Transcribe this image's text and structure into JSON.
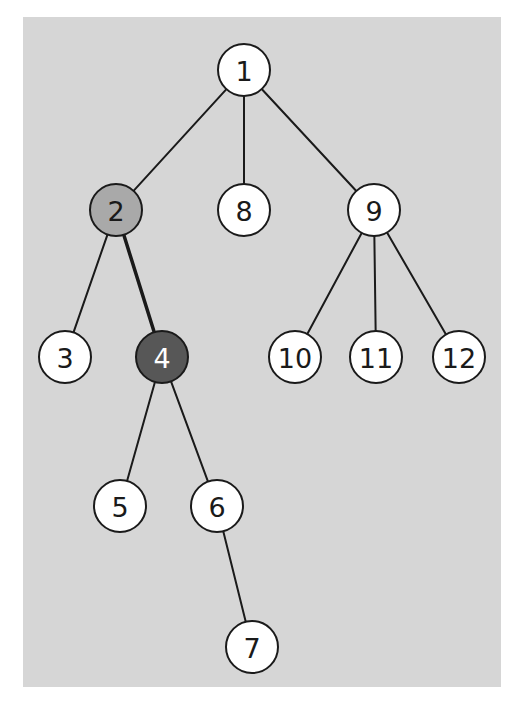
{
  "diagram": {
    "type": "tree",
    "background_color": "#d6d6d6",
    "panel": {
      "x": 23,
      "y": 17,
      "width": 478,
      "height": 670
    },
    "node_radius": 26,
    "styles": {
      "default": {
        "fill": "#ffffff",
        "text": "#1a1a1a"
      },
      "visited": {
        "fill": "#a9a9a9",
        "text": "#1a1a1a"
      },
      "current": {
        "fill": "#575757",
        "text": "#ffffff"
      }
    },
    "nodes": [
      {
        "id": "1",
        "label": "1",
        "x": 244,
        "y": 70,
        "state": "default"
      },
      {
        "id": "2",
        "label": "2",
        "x": 116,
        "y": 210,
        "state": "visited"
      },
      {
        "id": "8",
        "label": "8",
        "x": 244,
        "y": 210,
        "state": "default"
      },
      {
        "id": "9",
        "label": "9",
        "x": 374,
        "y": 210,
        "state": "default"
      },
      {
        "id": "3",
        "label": "3",
        "x": 65,
        "y": 357,
        "state": "default"
      },
      {
        "id": "4",
        "label": "4",
        "x": 162,
        "y": 357,
        "state": "current"
      },
      {
        "id": "10",
        "label": "10",
        "x": 295,
        "y": 357,
        "state": "default"
      },
      {
        "id": "11",
        "label": "11",
        "x": 376,
        "y": 357,
        "state": "default"
      },
      {
        "id": "12",
        "label": "12",
        "x": 459,
        "y": 357,
        "state": "default"
      },
      {
        "id": "5",
        "label": "5",
        "x": 120,
        "y": 506,
        "state": "default"
      },
      {
        "id": "6",
        "label": "6",
        "x": 217,
        "y": 506,
        "state": "default"
      },
      {
        "id": "7",
        "label": "7",
        "x": 252,
        "y": 647,
        "state": "default"
      }
    ],
    "edges": [
      {
        "from": "1",
        "to": "2",
        "highlighted": false
      },
      {
        "from": "1",
        "to": "8",
        "highlighted": false
      },
      {
        "from": "1",
        "to": "9",
        "highlighted": false
      },
      {
        "from": "2",
        "to": "3",
        "highlighted": false
      },
      {
        "from": "2",
        "to": "4",
        "highlighted": true
      },
      {
        "from": "9",
        "to": "10",
        "highlighted": false
      },
      {
        "from": "9",
        "to": "11",
        "highlighted": false
      },
      {
        "from": "9",
        "to": "12",
        "highlighted": false
      },
      {
        "from": "4",
        "to": "5",
        "highlighted": false
      },
      {
        "from": "4",
        "to": "6",
        "highlighted": false
      },
      {
        "from": "6",
        "to": "7",
        "highlighted": false
      }
    ]
  }
}
